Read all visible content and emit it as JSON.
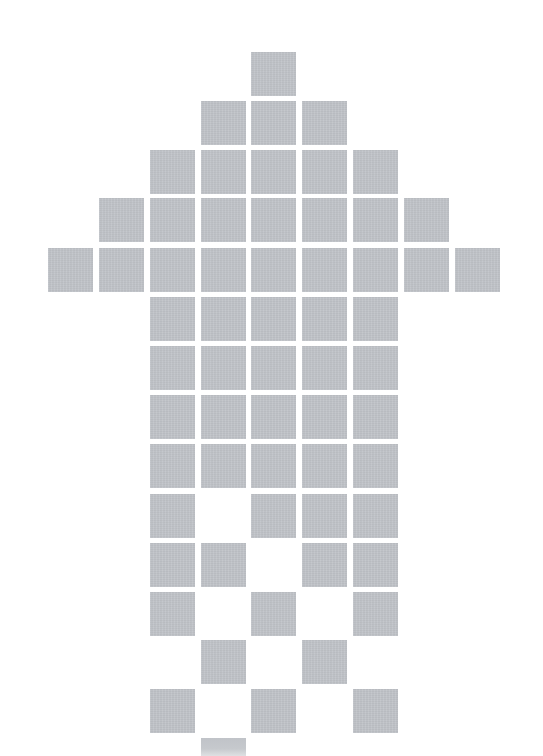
{
  "figure": {
    "tile_color": "#c0c3c8",
    "background_color": "#ffffff",
    "grid": {
      "columns": 9,
      "rows": 15,
      "col_x": [
        48,
        99,
        150,
        201,
        251,
        302,
        353,
        404,
        455
      ],
      "row_y": [
        52,
        101,
        150,
        198,
        248,
        297,
        346,
        395,
        444,
        494,
        543,
        592,
        640,
        689,
        738
      ],
      "tile_width": 45,
      "tile_height": 44
    },
    "rows": [
      [
        4
      ],
      [
        3,
        4,
        5
      ],
      [
        2,
        3,
        4,
        5,
        6
      ],
      [
        1,
        2,
        3,
        4,
        5,
        6,
        7
      ],
      [
        0,
        1,
        2,
        3,
        4,
        5,
        6,
        7,
        8
      ],
      [
        2,
        3,
        4,
        5,
        6
      ],
      [
        2,
        3,
        4,
        5,
        6
      ],
      [
        2,
        3,
        4,
        5,
        6
      ],
      [
        2,
        3,
        4,
        5,
        6
      ],
      [
        2,
        4,
        5,
        6
      ],
      [
        2,
        3,
        5,
        6
      ],
      [
        2,
        4,
        6
      ],
      [
        3,
        5
      ],
      [
        2,
        4,
        6
      ],
      [
        3
      ]
    ],
    "faded_last_row": true
  }
}
